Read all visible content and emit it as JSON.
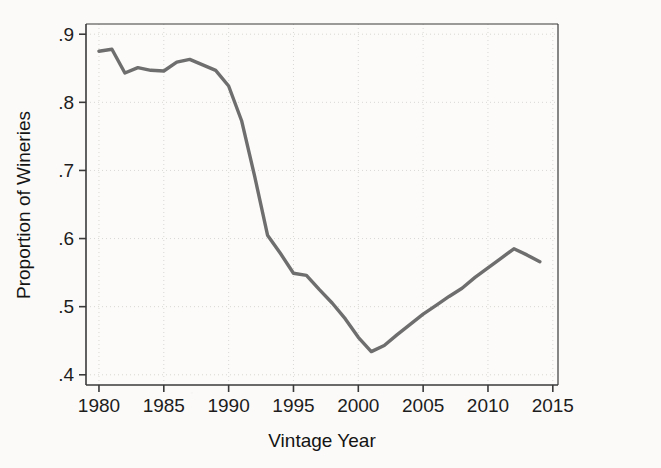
{
  "figure": {
    "background_color": "#fbfaf8",
    "plot_area_background": "#fcfbf9",
    "line_color": "#6e6e6e",
    "axis_color": "#3a3a3a",
    "grid_color": "#d8d8d4",
    "text_color": "#1d1d1d"
  },
  "chart_data": {
    "type": "line",
    "title": "",
    "xlabel": "Vintage Year",
    "ylabel": "Proportion of Wineries",
    "xlim": [
      1979,
      2015.4
    ],
    "ylim": [
      0.385,
      0.915
    ],
    "xticks": [
      1980,
      1985,
      1990,
      1995,
      2000,
      2005,
      2010,
      2015
    ],
    "xtick_labels": [
      "1980",
      "1985",
      "1990",
      "1995",
      "2000",
      "2005",
      "2010",
      "2015"
    ],
    "yticks": [
      0.4,
      0.5,
      0.6,
      0.7,
      0.8,
      0.9
    ],
    "ytick_labels": [
      ".4",
      ".5",
      ".6",
      ".7",
      ".8",
      ".9"
    ],
    "grid": "dotted-light",
    "legend": "none",
    "series": [
      {
        "name": "Proportion of Wineries",
        "x": [
          1980,
          1981,
          1982,
          1983,
          1984,
          1985,
          1986,
          1987,
          1988,
          1989,
          1990,
          1991,
          1992,
          1993,
          1994,
          1995,
          1996,
          1997,
          1998,
          1999,
          2000,
          2001,
          2002,
          2003,
          2004,
          2005,
          2006,
          2007,
          2008,
          2009,
          2010,
          2011,
          2012,
          2013,
          2014
        ],
        "values": [
          0.875,
          0.878,
          0.843,
          0.851,
          0.847,
          0.846,
          0.859,
          0.863,
          0.855,
          0.847,
          0.824,
          0.773,
          0.692,
          0.605,
          0.578,
          0.549,
          0.546,
          0.525,
          0.505,
          0.482,
          0.455,
          0.434,
          0.443,
          0.459,
          0.474,
          0.489,
          0.502,
          0.515,
          0.527,
          0.543,
          0.557,
          0.571,
          0.585,
          0.576,
          0.566
        ]
      }
    ],
    "annotations": []
  }
}
